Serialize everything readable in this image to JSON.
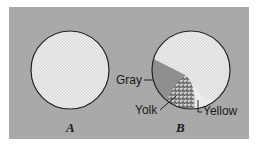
{
  "figure": {
    "panels": [
      {
        "id": "A",
        "caption": "A",
        "description": "uniform stippled circle"
      },
      {
        "id": "B",
        "caption": "B",
        "description": "circle divided into regions"
      }
    ],
    "labels": {
      "gray": "Gray",
      "yolk": "Yolk",
      "yellow": "Yellow"
    },
    "colors": {
      "background": "#a9a9a9",
      "light_fill": "#e6e6e6",
      "gray_region": "#8f8f8f",
      "yolk_fill": "#6d6d6d",
      "outline": "#222222"
    }
  }
}
